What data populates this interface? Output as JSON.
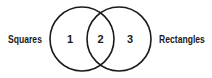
{
  "diagram": {
    "type": "venn",
    "sets": [
      {
        "name": "Squares",
        "region_label": "1"
      },
      {
        "name": "Rectangles",
        "region_label": "3"
      }
    ],
    "intersection_label": "2",
    "colors": {
      "stroke": "#1a1a1a",
      "background": "#ffffff",
      "text": "#1a1a1a"
    }
  }
}
